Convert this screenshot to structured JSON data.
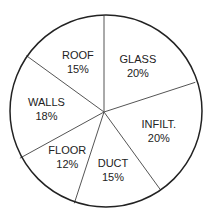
{
  "chart_data": {
    "type": "pie",
    "title": "",
    "categories": [
      "GLASS",
      "INFILT.",
      "DUCT",
      "FLOOR",
      "WALLS",
      "ROOF"
    ],
    "values": [
      20,
      20,
      15,
      12,
      18,
      15
    ],
    "unit": "%",
    "labels": [
      {
        "name": "GLASS",
        "value": "20%"
      },
      {
        "name": "INFILT.",
        "value": "20%"
      },
      {
        "name": "DUCT",
        "value": "15%"
      },
      {
        "name": "FLOOR",
        "value": "12%"
      },
      {
        "name": "WALLS",
        "value": "18%"
      },
      {
        "name": "ROOF",
        "value": "15%"
      }
    ],
    "legend": "none",
    "start_angle_deg": 0,
    "direction": "clockwise",
    "colors": {
      "fill": "#ffffff",
      "stroke": "#222222",
      "divider": "#555555"
    }
  }
}
